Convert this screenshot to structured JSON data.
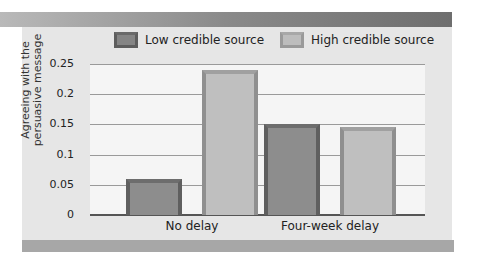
{
  "chart_data": {
    "type": "bar",
    "title": "",
    "xlabel": "",
    "ylabel": "Agreeing with the persuasive message",
    "ylabel_lines": [
      "Agreeing with the",
      "persuasive message"
    ],
    "categories": [
      "No delay",
      "Four-week delay"
    ],
    "series": [
      {
        "name": "Low credible source",
        "values": [
          0.06,
          0.15
        ],
        "color": "#8d8d8d"
      },
      {
        "name": "High credible source",
        "values": [
          0.24,
          0.145
        ],
        "color": "#bfbfbf"
      }
    ],
    "yticks": [
      "0",
      "0.05",
      "0.1",
      "0.15",
      "0.2",
      "0.25"
    ],
    "ylim": [
      0,
      0.25
    ],
    "grid": true,
    "legend_position": "top"
  },
  "legend": {
    "low_label": "Low credible source",
    "high_label": "High credible source"
  }
}
